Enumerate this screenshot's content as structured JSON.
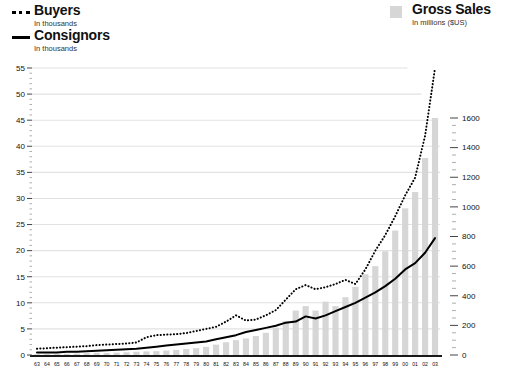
{
  "title_fragment": "y",
  "legend": {
    "buyers": {
      "label": "Buyers",
      "sublabel": "In thousands",
      "marker": "dotted-line-swatch",
      "color": "#000000"
    },
    "consignors": {
      "label": "Consignors",
      "sublabel": "In thousands",
      "marker": "solid-line-swatch",
      "color": "#000000"
    },
    "gross_sales": {
      "label": "Gross Sales",
      "sublabel": "In millions ($US)",
      "marker": "square-swatch",
      "color": "#d6d6d6"
    }
  },
  "axes": {
    "left": {
      "ticks": [
        "0",
        "5",
        "10",
        "15",
        "20",
        "25",
        "30",
        "35",
        "40",
        "45",
        "50",
        "55"
      ],
      "min": 0,
      "max": 55
    },
    "right": {
      "ticks": [
        "0",
        "200",
        "400",
        "600",
        "800",
        "1000",
        "1200",
        "1400",
        "1600"
      ],
      "min": 0,
      "max": 1600
    },
    "bottom": {
      "ticks": [
        "63",
        "64",
        "65",
        "66",
        "67",
        "68",
        "69",
        "70",
        "71",
        "72",
        "73",
        "74",
        "75",
        "76",
        "77",
        "78",
        "79",
        "80",
        "81",
        "82",
        "83",
        "84",
        "85",
        "86",
        "87",
        "88",
        "89",
        "90",
        "91",
        "92",
        "93",
        "94",
        "95",
        "96",
        "97",
        "98",
        "99",
        "00",
        "01",
        "02",
        "03"
      ]
    }
  },
  "chart_data": {
    "type": "bar",
    "title": "",
    "subtitle": "",
    "xlabel": "",
    "ylabel": "In thousands",
    "y2label": "In millions ($US)",
    "ylim": [
      0,
      55
    ],
    "y2lim": [
      0,
      1600
    ],
    "grid": true,
    "legend_position": "top",
    "categories": [
      "63",
      "64",
      "65",
      "66",
      "67",
      "68",
      "69",
      "70",
      "71",
      "72",
      "73",
      "74",
      "75",
      "76",
      "77",
      "78",
      "79",
      "80",
      "81",
      "82",
      "83",
      "84",
      "85",
      "86",
      "87",
      "88",
      "89",
      "90",
      "91",
      "92",
      "93",
      "94",
      "95",
      "96",
      "97",
      "98",
      "99",
      "00",
      "01",
      "02",
      "03"
    ],
    "series": [
      {
        "name": "Gross Sales",
        "type": "bar",
        "axis": "right",
        "unit": "millions ($US)",
        "color": "#d6d6d6",
        "values": [
          5,
          6,
          7,
          8,
          9,
          12,
          15,
          14,
          16,
          18,
          22,
          24,
          26,
          30,
          34,
          40,
          46,
          55,
          70,
          86,
          100,
          112,
          128,
          150,
          185,
          230,
          300,
          330,
          300,
          360,
          330,
          390,
          460,
          545,
          600,
          700,
          840,
          990,
          1100,
          1330,
          1600
        ]
      },
      {
        "name": "Buyers",
        "type": "line",
        "style": "dotted",
        "axis": "left",
        "unit": "thousands",
        "color": "#000000",
        "values": [
          1.2,
          1.3,
          1.4,
          1.5,
          1.6,
          1.7,
          1.9,
          2.0,
          2.1,
          2.2,
          2.4,
          3.4,
          3.8,
          3.9,
          4.0,
          4.2,
          4.6,
          5.0,
          5.4,
          6.4,
          7.6,
          6.6,
          6.8,
          7.6,
          8.6,
          10.6,
          12.6,
          13.4,
          12.6,
          13.0,
          13.6,
          14.4,
          13.6,
          16.4,
          20.0,
          23.0,
          26.6,
          30.6,
          34.0,
          42.0,
          55.0
        ]
      },
      {
        "name": "Consignors",
        "type": "line",
        "style": "solid",
        "axis": "left",
        "unit": "thousands",
        "color": "#000000",
        "values": [
          0.5,
          0.5,
          0.5,
          0.6,
          0.6,
          0.7,
          0.8,
          0.9,
          1.0,
          1.1,
          1.2,
          1.4,
          1.6,
          1.8,
          2.0,
          2.2,
          2.4,
          2.6,
          3.0,
          3.4,
          3.8,
          4.4,
          4.8,
          5.2,
          5.6,
          6.2,
          6.4,
          7.4,
          7.0,
          7.6,
          8.4,
          9.2,
          10.0,
          11.0,
          12.0,
          13.2,
          14.6,
          16.4,
          17.6,
          19.6,
          22.4
        ]
      }
    ]
  }
}
